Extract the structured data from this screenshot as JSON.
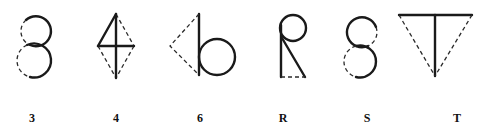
{
  "figure": {
    "glyphs": [
      {
        "id": "3",
        "label": "3",
        "shape": "two stacked circles, right halves solid, left halves dashed"
      },
      {
        "id": "4",
        "label": "4",
        "shape": "rhombus with vertical and horizontal axes; upper-left edge and cross solid, other edges dashed"
      },
      {
        "id": "6",
        "label": "6",
        "shape": "vertical line with circle at lower right; dashed triangle on left"
      },
      {
        "id": "R",
        "label": "R",
        "shape": "vertical line, circle at top, diagonal leg solid; dashed base"
      },
      {
        "id": "S",
        "label": "S",
        "shape": "two stacked circles, top-left and bottom-right solid, others dashed"
      },
      {
        "id": "T",
        "label": "T",
        "shape": "top bar and vertical stem solid; dashed inverted triangle sides"
      }
    ]
  },
  "colors": {
    "stroke": "#1a1a1a",
    "background": "#ffffff"
  }
}
